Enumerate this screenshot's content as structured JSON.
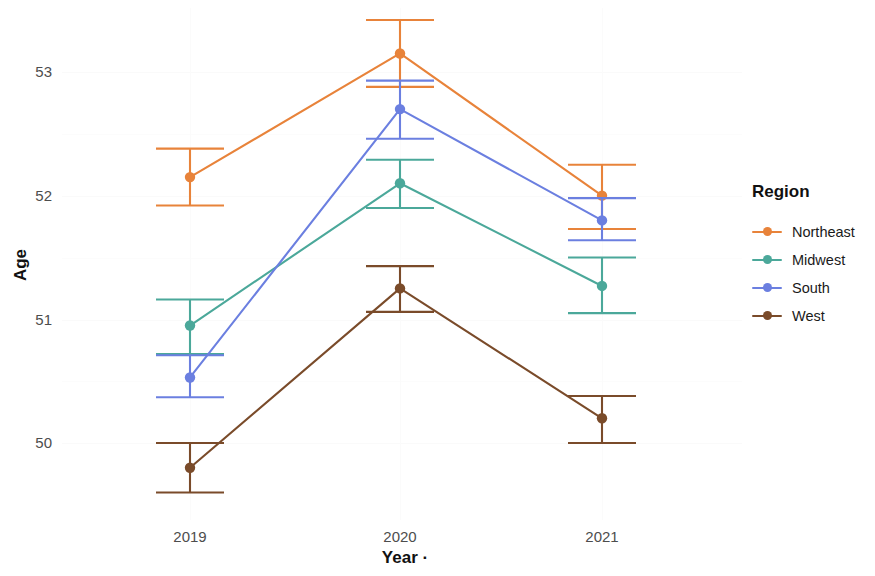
{
  "chart_data": {
    "type": "line",
    "title": "",
    "xlabel": "Year ·",
    "ylabel": "Age",
    "categories": [
      "2019",
      "2020",
      "2021"
    ],
    "x": [
      2019,
      2020,
      2021
    ],
    "ylim": [
      49.45,
      53.45
    ],
    "yticks": [
      50,
      51,
      52,
      53
    ],
    "ytick_labels": [
      "50",
      "51",
      "52",
      "53"
    ],
    "xtick_labels": [
      "2019",
      "2020",
      "2021"
    ],
    "grid": true,
    "error_bars": true,
    "legend_position": "right",
    "legend_title": "Region",
    "series": [
      {
        "name": "Northeast",
        "color": "#E8833A",
        "values": [
          52.15,
          53.15,
          52.0
        ],
        "err_low": [
          51.92,
          52.88,
          51.73
        ],
        "err_high": [
          52.38,
          53.42,
          52.25
        ]
      },
      {
        "name": "Midwest",
        "color": "#4BA89A",
        "values": [
          50.95,
          52.1,
          51.27
        ],
        "err_low": [
          50.72,
          51.9,
          51.05
        ],
        "err_high": [
          51.16,
          52.29,
          51.5
        ]
      },
      {
        "name": "South",
        "color": "#6B7FE0",
        "values": [
          50.53,
          52.7,
          51.8
        ],
        "err_low": [
          50.37,
          52.46,
          51.64
        ],
        "err_high": [
          50.71,
          52.93,
          51.98
        ]
      },
      {
        "name": "West",
        "color": "#7A4B2A",
        "values": [
          49.8,
          51.25,
          50.2
        ],
        "err_low": [
          49.6,
          51.06,
          50.0
        ],
        "err_high": [
          50.0,
          51.43,
          50.38
        ]
      }
    ]
  },
  "axes": {
    "y_title": "Age",
    "x_title": "Year ·",
    "y_tick_0": "50",
    "y_tick_1": "51",
    "y_tick_2": "52",
    "y_tick_3": "53",
    "x_tick_0": "2019",
    "x_tick_1": "2020",
    "x_tick_2": "2021"
  },
  "legend": {
    "title": "Region",
    "items": [
      {
        "label": "Northeast",
        "color": "#E8833A"
      },
      {
        "label": "Midwest",
        "color": "#4BA89A"
      },
      {
        "label": "South",
        "color": "#6B7FE0"
      },
      {
        "label": "West",
        "color": "#7A4B2A"
      }
    ]
  }
}
